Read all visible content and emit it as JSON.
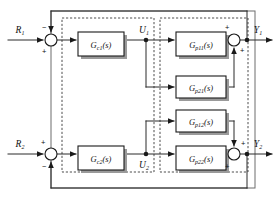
{
  "diagram": {
    "type": "control-system-block-diagram",
    "colors": {
      "line": "#2b2b2b",
      "block_border": "#1a1a1a",
      "block_fill": "#ffffff",
      "block_shadow": "#9a9a9a",
      "dotted_box": "#3a3a3a",
      "outer_box": "#6d6d6d",
      "background": "#ffffff",
      "text": "#111111"
    },
    "inputs": [
      {
        "name": "input-r1",
        "base": "R",
        "sub": "1",
        "x": 22,
        "y": 32
      },
      {
        "name": "input-r2",
        "base": "R",
        "sub": "2",
        "x": 22,
        "y": 146
      }
    ],
    "outputs": [
      {
        "name": "output-y1",
        "base": "Y",
        "sub": "1",
        "x": 257,
        "y": 32
      },
      {
        "name": "output-y2",
        "base": "Y",
        "sub": "2",
        "x": 257,
        "y": 146
      }
    ],
    "internal_signals": [
      {
        "name": "signal-u1",
        "base": "U",
        "sub": "1",
        "x": 143,
        "y": 33
      },
      {
        "name": "signal-u2",
        "base": "U",
        "sub": "2",
        "x": 143,
        "y": 163
      }
    ],
    "controller_blocks": [
      {
        "name": "block-gc1",
        "base": "G",
        "sub": "c1",
        "arg": "(s)",
        "x": 78,
        "y": 32,
        "w": 46,
        "h": 24
      },
      {
        "name": "block-gc2",
        "base": "G",
        "sub": "c2",
        "arg": "(s)",
        "x": 78,
        "y": 146,
        "w": 46,
        "h": 24
      }
    ],
    "plant_blocks": [
      {
        "name": "block-gp11",
        "base": "G",
        "sub": "p11",
        "arg": "(s)",
        "x": 176,
        "y": 32,
        "w": 50,
        "h": 24
      },
      {
        "name": "block-gp21",
        "base": "G",
        "sub": "p21",
        "arg": "(s)",
        "x": 176,
        "y": 76,
        "w": 50,
        "h": 22
      },
      {
        "name": "block-gp12",
        "base": "G",
        "sub": "p12",
        "arg": "(s)",
        "x": 176,
        "y": 110,
        "w": 50,
        "h": 22
      },
      {
        "name": "block-gp22",
        "base": "G",
        "sub": "p22",
        "arg": "(s)",
        "x": 176,
        "y": 146,
        "w": 50,
        "h": 24
      }
    ],
    "summing_junctions": [
      {
        "name": "sum-junction-r1",
        "cx": 51,
        "cy": 40,
        "r": 6,
        "signs": [
          {
            "label": "−",
            "x": 42,
            "y": 27
          },
          {
            "label": "+",
            "x": 42,
            "y": 52
          }
        ]
      },
      {
        "name": "sum-junction-r2",
        "cx": 51,
        "cy": 154,
        "r": 6,
        "signs": [
          {
            "label": "+",
            "x": 41,
            "y": 142
          },
          {
            "label": "−",
            "x": 42,
            "y": 168
          }
        ]
      },
      {
        "name": "sum-junction-y1",
        "cx": 234,
        "cy": 40,
        "r": 6,
        "signs": [
          {
            "label": "+",
            "x": 226,
            "y": 28
          },
          {
            "label": "+",
            "x": 240,
            "y": 51
          }
        ]
      },
      {
        "name": "sum-junction-y2",
        "cx": 234,
        "cy": 154,
        "r": 6,
        "signs": [
          {
            "label": "+",
            "x": 241,
            "y": 143
          },
          {
            "label": "+",
            "x": 226,
            "y": 168
          }
        ]
      }
    ],
    "dotted_groups": [
      {
        "name": "controller-group-box",
        "x": 62,
        "y": 18,
        "w": 92,
        "h": 154
      },
      {
        "name": "plant-group-box",
        "x": 160,
        "y": 18,
        "w": 88,
        "h": 154
      }
    ],
    "outer_frame": {
      "name": "outer-frame-box",
      "x": 51,
      "y": 11,
      "w": 204,
      "h": 177
    },
    "junction_dots": [
      {
        "name": "tap-u1",
        "cx": 146,
        "cy": 40
      },
      {
        "name": "tap-u2",
        "cx": 146,
        "cy": 154
      },
      {
        "name": "tap-y1",
        "cx": 247,
        "cy": 40
      },
      {
        "name": "tap-y2",
        "cx": 247,
        "cy": 154
      },
      {
        "name": "tap-gp21-out",
        "cx": 234,
        "cy": 87
      },
      {
        "name": "tap-gp12-out",
        "cx": 234,
        "cy": 121
      }
    ]
  }
}
